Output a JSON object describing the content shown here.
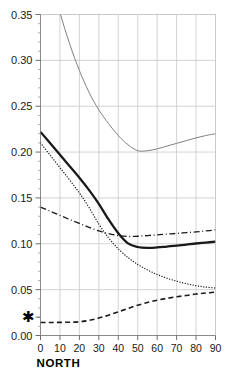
{
  "chart_data": {
    "type": "line",
    "title": "",
    "xlabel": "NORTH",
    "ylabel": "",
    "xlim": [
      0,
      90
    ],
    "ylim": [
      0.0,
      0.35
    ],
    "grid": true,
    "legend_position": "none",
    "xticks": [
      0,
      10,
      20,
      30,
      40,
      50,
      60,
      70,
      80,
      90
    ],
    "xtick_labels": [
      "0",
      "10",
      "20",
      "30",
      "40",
      "50",
      "60",
      "70",
      "80",
      "90"
    ],
    "yticks": [
      0.0,
      0.05,
      0.1,
      0.15,
      0.2,
      0.25,
      0.3,
      0.35
    ],
    "ytick_labels": [
      "0.00",
      "0.05",
      "0.10",
      "0.15",
      "0.20",
      "0.25",
      "0.30",
      "0.35"
    ],
    "y_minor_tick_step": 0.01,
    "annotations": [
      {
        "name": "star-marker",
        "symbol": "✱",
        "x_axis_value": 0,
        "y_value": 0.02,
        "position": "y-axis-left",
        "description": "star symbol on y axis at 0.02"
      }
    ],
    "x": [
      0,
      5,
      10,
      15,
      20,
      25,
      30,
      35,
      40,
      45,
      50,
      55,
      60,
      65,
      70,
      75,
      80,
      85,
      90
    ],
    "series": [
      {
        "name": "thin-solid-upper",
        "style": "solid",
        "color": "#808080",
        "width": 1,
        "values": [
          0.43,
          0.39,
          0.352,
          0.318,
          0.289,
          0.265,
          0.246,
          0.231,
          0.218,
          0.208,
          0.2015,
          0.2015,
          0.2035,
          0.2065,
          0.2095,
          0.2125,
          0.2155,
          0.218,
          0.22
        ]
      },
      {
        "name": "thick-solid",
        "style": "solid",
        "color": "#1a1a1a",
        "width": 2.3,
        "values": [
          0.222,
          0.2095,
          0.197,
          0.1845,
          0.172,
          0.1585,
          0.1435,
          0.1265,
          0.1115,
          0.1005,
          0.0965,
          0.0955,
          0.096,
          0.097,
          0.098,
          0.0992,
          0.1003,
          0.1013,
          0.1023
        ]
      },
      {
        "name": "dotted",
        "style": "dotted",
        "color": "#1a1a1a",
        "width": 1.3,
        "values": [
          0.21,
          0.1965,
          0.183,
          0.1695,
          0.1555,
          0.1395,
          0.1215,
          0.1065,
          0.0945,
          0.085,
          0.0775,
          0.0715,
          0.0665,
          0.0625,
          0.0592,
          0.0565,
          0.0543,
          0.0528,
          0.0518
        ]
      },
      {
        "name": "dash-dot",
        "style": "dashdot",
        "color": "#1a1a1a",
        "width": 1.3,
        "values": [
          0.14,
          0.1355,
          0.131,
          0.1265,
          0.1222,
          0.118,
          0.114,
          0.111,
          0.109,
          0.108,
          0.1082,
          0.109,
          0.1098,
          0.1106,
          0.1113,
          0.1122,
          0.113,
          0.114,
          0.1152
        ]
      },
      {
        "name": "dashed-lower",
        "style": "dashed",
        "color": "#1a1a1a",
        "width": 1.6,
        "values": [
          0.0142,
          0.0142,
          0.0143,
          0.0145,
          0.015,
          0.0165,
          0.019,
          0.0222,
          0.0258,
          0.0295,
          0.033,
          0.036,
          0.0385,
          0.0405,
          0.0422,
          0.0437,
          0.0452,
          0.0463,
          0.0472
        ]
      }
    ],
    "colors": {
      "grid": "#c8c8c8",
      "axis": "#808080",
      "text": "#1a1a1a",
      "upper_curve": "#808080",
      "main_curve": "#1a1a1a"
    }
  }
}
